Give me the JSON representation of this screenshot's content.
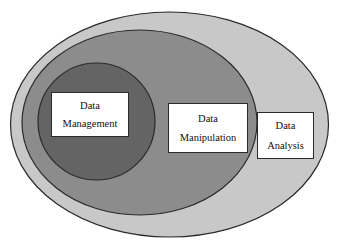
{
  "diagram": {
    "type": "nested-venn",
    "background_color": "#ffffff",
    "stroke_color": "#2a2a2a",
    "regions": [
      {
        "id": "analysis",
        "name": "Data Analysis",
        "shape": "ellipse",
        "fill_color": "#c8c8c8",
        "level": 1,
        "label_line_1": "Data",
        "label_line_2": "Analysis"
      },
      {
        "id": "manipulation",
        "name": "Data Manipulation",
        "shape": "ellipse",
        "fill_color": "#8c8c8c",
        "level": 2,
        "label_line_1": "Data",
        "label_line_2": "Manipulation"
      },
      {
        "id": "management",
        "name": "Data Management",
        "shape": "circle",
        "fill_color": "#646464",
        "level": 3,
        "label_line_1": "Data",
        "label_line_2": "Management"
      }
    ]
  }
}
